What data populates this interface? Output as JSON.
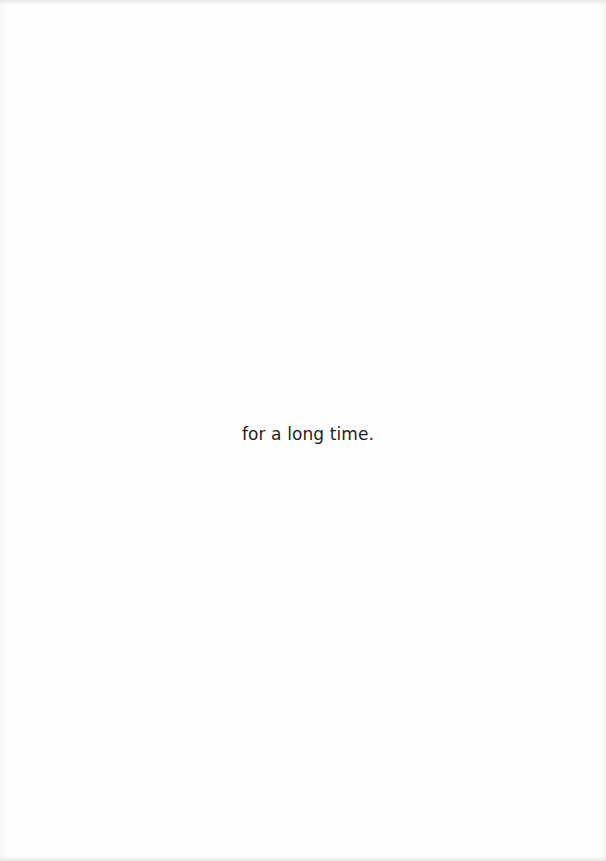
{
  "page": {
    "text": "for a long time."
  }
}
